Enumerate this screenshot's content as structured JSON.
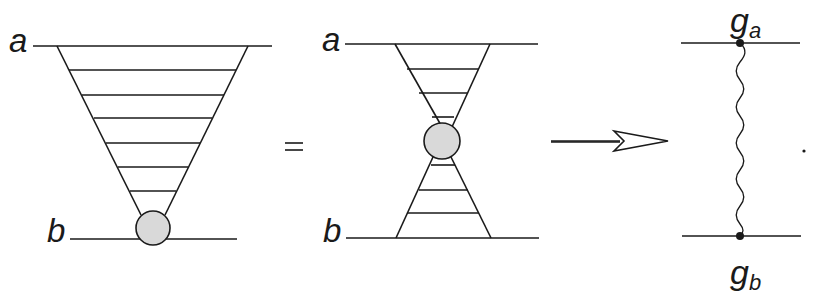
{
  "diagram": {
    "panels": [
      {
        "id": "ladder-left",
        "top_label": "a",
        "bottom_label": "b",
        "rung_count": 6,
        "blob": "grey circle at bottom vertex"
      },
      {
        "id": "ladder-middle",
        "top_label": "a",
        "bottom_label": "b",
        "rung_count_top": 3,
        "rung_count_bottom": 3,
        "blob": "grey circle at center"
      },
      {
        "id": "exchange-right",
        "top_label": "g",
        "top_subscript": "a",
        "bottom_label": "g",
        "bottom_subscript": "b",
        "propagator": "wavy line"
      }
    ],
    "equals_sign": "=",
    "arrow": "open-head arrow",
    "trailing_punctuation": "."
  },
  "colors": {
    "line": "#1a1a1a",
    "blob_fill": "#d9d9d9",
    "background": "#ffffff"
  }
}
